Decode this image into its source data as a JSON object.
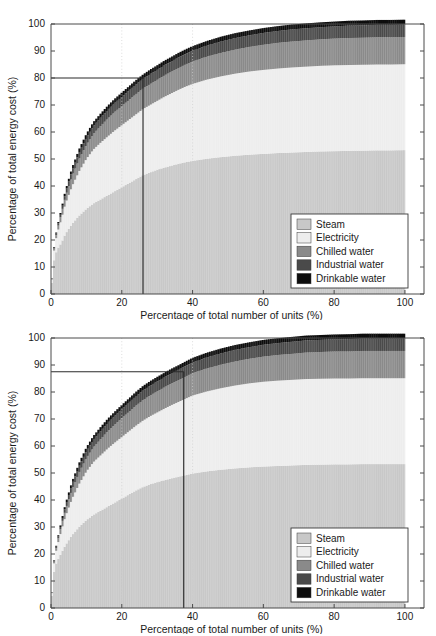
{
  "top_artifact": {
    "text": "cut-off caption remnant (illegible)"
  },
  "figures": [
    {
      "id": "upper",
      "name": "pareto-chart-80",
      "axis": {
        "xlabel": "Percentage of total number of units (%)",
        "ylabel": "Percentage of total energy cost (%)",
        "xticks": [
          "0",
          "20",
          "40",
          "60",
          "80",
          "100"
        ],
        "yticks": [
          "0",
          "10",
          "20",
          "30",
          "40",
          "50",
          "60",
          "70",
          "80",
          "90",
          "100"
        ]
      },
      "marker": {
        "y_value": "80",
        "x_value": "26"
      },
      "legend": {
        "items": [
          {
            "label": "Steam",
            "color": "#c8c8c8"
          },
          {
            "label": "Electricity",
            "color": "#ededed"
          },
          {
            "label": "Chilled water",
            "color": "#8a8a8a"
          },
          {
            "label": "Industrial water",
            "color": "#4a4a4a"
          },
          {
            "label": "Drinkable water",
            "color": "#0d0d0d"
          }
        ]
      }
    },
    {
      "id": "lower",
      "name": "pareto-chart-87",
      "axis": {
        "xlabel": "Percentage of total number of units (%)",
        "ylabel": "Percentage of total energy cost (%)",
        "xticks": [
          "0",
          "20",
          "40",
          "60",
          "80",
          "100"
        ],
        "yticks": [
          "0",
          "10",
          "20",
          "30",
          "40",
          "50",
          "60",
          "70",
          "80",
          "90",
          "100"
        ]
      },
      "marker": {
        "y_value": "87.5",
        "x_value": "37.5"
      },
      "legend": {
        "items": [
          {
            "label": "Steam",
            "color": "#c8c8c8"
          },
          {
            "label": "Electricity",
            "color": "#ededed"
          },
          {
            "label": "Chilled water",
            "color": "#8a8a8a"
          },
          {
            "label": "Industrial water",
            "color": "#4a4a4a"
          },
          {
            "label": "Drinkable water",
            "color": "#0d0d0d"
          }
        ]
      }
    }
  ],
  "chart_data": [
    {
      "type": "area",
      "title": "",
      "xlabel": "Percentage of total number of units (%)",
      "ylabel": "Percentage of total energy cost (%)",
      "xlim": [
        0,
        102
      ],
      "ylim": [
        0,
        100
      ],
      "grid": "vertical dashed at x = 20 and x = 40",
      "legend_position": "lower right",
      "annotation": {
        "type": "pareto-crosshair",
        "x": 26,
        "y": 80,
        "description": "26% of units account for 80% of total energy cost"
      },
      "x": [
        0,
        1,
        2,
        3,
        4,
        5,
        6,
        8,
        10,
        12,
        14,
        16,
        18,
        20,
        22,
        24,
        26,
        28,
        30,
        32,
        34,
        36,
        38,
        40,
        44,
        48,
        52,
        56,
        60,
        64,
        68,
        72,
        76,
        80,
        84,
        88,
        92,
        96,
        100
      ],
      "series": [
        {
          "name": "Steam",
          "values": [
            0,
            14,
            17,
            19,
            22,
            24,
            26,
            29,
            31.5,
            33.5,
            35,
            36.5,
            38,
            39.5,
            41,
            42.5,
            44,
            45,
            46,
            46.8,
            47.5,
            48.2,
            48.8,
            49.3,
            50.1,
            50.7,
            51.2,
            51.6,
            51.9,
            52.2,
            52.4,
            52.6,
            52.8,
            52.9,
            53,
            53.1,
            53.2,
            53.2,
            53.3
          ]
        },
        {
          "name": "Electricity",
          "values": [
            0,
            4,
            6.5,
            9,
            11,
            12.5,
            14,
            16.5,
            18.5,
            20,
            21,
            21.8,
            22.5,
            23,
            23.5,
            24,
            24.5,
            25,
            25.5,
            26.2,
            26.8,
            27.4,
            28,
            28.5,
            29.3,
            29.9,
            30.4,
            30.8,
            31.1,
            31.3,
            31.5,
            31.6,
            31.7,
            31.8,
            31.8,
            31.8,
            31.8,
            31.8,
            31.8
          ]
        },
        {
          "name": "Chilled water",
          "values": [
            0,
            0.8,
            1.4,
            2,
            2.6,
            3.2,
            3.8,
            4.6,
            5.2,
            5.8,
            6.2,
            6.6,
            6.9,
            7.1,
            7.3,
            7.5,
            7.6,
            7.7,
            7.8,
            7.9,
            8,
            8.1,
            8.2,
            8.3,
            8.5,
            8.7,
            8.9,
            9.1,
            9.3,
            9.5,
            9.6,
            9.7,
            9.8,
            9.9,
            10,
            10,
            10.1,
            10.1,
            10.1
          ]
        },
        {
          "name": "Industrial water",
          "values": [
            0,
            0.4,
            0.8,
            1.1,
            1.4,
            1.7,
            2,
            2.4,
            2.7,
            2.9,
            3.1,
            3.2,
            3.3,
            3.4,
            3.5,
            3.6,
            3.6,
            3.7,
            3.7,
            3.8,
            3.8,
            3.9,
            3.9,
            4,
            4.1,
            4.2,
            4.3,
            4.3,
            4.4,
            4.4,
            4.5,
            4.5,
            4.5,
            4.5,
            4.6,
            4.6,
            4.6,
            4.6,
            4.6
          ]
        },
        {
          "name": "Drinkable water",
          "values": [
            0,
            0.3,
            0.5,
            0.7,
            0.9,
            1,
            1.1,
            1.3,
            1.4,
            1.5,
            1.5,
            1.6,
            1.6,
            1.6,
            1.6,
            1.6,
            1.6,
            1.7,
            1.7,
            1.7,
            1.7,
            1.7,
            1.7,
            1.7,
            1.7,
            1.8,
            1.8,
            1.8,
            1.8,
            1.8,
            1.8,
            1.8,
            1.8,
            1.8,
            1.8,
            1.8,
            1.8,
            1.8,
            1.8
          ]
        }
      ],
      "cumulative_total": [
        0,
        19.5,
        26.2,
        31.8,
        37.9,
        42.4,
        46.9,
        53.8,
        59.3,
        63.7,
        66.8,
        69.7,
        72.3,
        74.6,
        76.9,
        79.2,
        81.3,
        83.1,
        84.7,
        86.4,
        87.8,
        89.3,
        90.6,
        91.8,
        93.7,
        95.3,
        96.6,
        97.6,
        98.5,
        99.2,
        99.8,
        100,
        100,
        100,
        100,
        100,
        100,
        100,
        100
      ]
    },
    {
      "type": "area",
      "title": "",
      "xlabel": "Percentage of total number of units (%)",
      "ylabel": "Percentage of total energy cost (%)",
      "xlim": [
        0,
        102
      ],
      "ylim": [
        0,
        100
      ],
      "grid": "vertical dashed at x = 20 and x = 40",
      "legend_position": "lower right",
      "annotation": {
        "type": "pareto-crosshair",
        "x": 37.5,
        "y": 87.5,
        "description": "37.5% of units account for 87.5% of total energy cost"
      },
      "x": [
        0,
        1,
        2,
        3,
        4,
        5,
        6,
        8,
        10,
        12,
        14,
        16,
        18,
        20,
        22,
        24,
        26,
        28,
        30,
        32,
        34,
        36,
        38,
        40,
        44,
        48,
        52,
        56,
        60,
        64,
        68,
        72,
        76,
        80,
        84,
        88,
        92,
        96,
        100
      ],
      "series": [
        {
          "name": "Steam",
          "values": [
            0,
            15,
            18,
            20.5,
            23,
            25,
            27,
            30,
            32.5,
            34.5,
            36,
            37.5,
            39,
            40.5,
            42,
            43.5,
            44.8,
            45.8,
            46.6,
            47.3,
            48,
            48.6,
            49.2,
            49.8,
            50.6,
            51.2,
            51.7,
            52.1,
            52.4,
            52.6,
            52.8,
            53,
            53.1,
            53.2,
            53.2,
            53.3,
            53.3,
            53.3,
            53.3
          ]
        },
        {
          "name": "Electricity",
          "values": [
            0,
            3.5,
            6,
            8.5,
            10.5,
            12,
            13.5,
            16,
            18,
            19.5,
            20.5,
            21.5,
            22.2,
            22.8,
            23.4,
            24,
            24.6,
            25.2,
            25.8,
            26.5,
            27.1,
            27.7,
            28.3,
            28.9,
            29.6,
            30.2,
            30.7,
            31.1,
            31.4,
            31.6,
            31.7,
            31.8,
            31.8,
            31.8,
            31.8,
            31.8,
            31.8,
            31.8,
            31.8
          ]
        },
        {
          "name": "Chilled water",
          "values": [
            0,
            0.7,
            1.3,
            1.9,
            2.4,
            3,
            3.5,
            4.3,
            5,
            5.5,
            6,
            6.4,
            6.7,
            7,
            7.2,
            7.4,
            7.6,
            7.7,
            7.8,
            7.9,
            8,
            8.1,
            8.2,
            8.3,
            8.5,
            8.7,
            8.9,
            9.1,
            9.3,
            9.5,
            9.6,
            9.8,
            9.9,
            10,
            10,
            10.1,
            10.1,
            10.1,
            10.1
          ]
        },
        {
          "name": "Industrial water",
          "values": [
            0,
            0.35,
            0.7,
            1,
            1.3,
            1.6,
            1.9,
            2.3,
            2.6,
            2.8,
            3,
            3.1,
            3.2,
            3.3,
            3.4,
            3.5,
            3.6,
            3.6,
            3.7,
            3.7,
            3.8,
            3.8,
            3.9,
            3.9,
            4.1,
            4.2,
            4.3,
            4.3,
            4.4,
            4.4,
            4.5,
            4.5,
            4.5,
            4.5,
            4.6,
            4.6,
            4.6,
            4.6,
            4.6
          ]
        },
        {
          "name": "Drinkable water",
          "values": [
            0,
            0.25,
            0.45,
            0.65,
            0.85,
            0.95,
            1.05,
            1.25,
            1.35,
            1.45,
            1.5,
            1.55,
            1.6,
            1.6,
            1.6,
            1.65,
            1.65,
            1.7,
            1.7,
            1.7,
            1.7,
            1.7,
            1.7,
            1.75,
            1.75,
            1.8,
            1.8,
            1.8,
            1.8,
            1.8,
            1.8,
            1.8,
            1.8,
            1.8,
            1.8,
            1.8,
            1.8,
            1.8,
            1.8
          ]
        }
      ],
      "cumulative_total": [
        0,
        19.8,
        26.45,
        32.55,
        38.05,
        42.55,
        46.95,
        53.85,
        59.45,
        63.75,
        67.0,
        70.05,
        72.7,
        75.2,
        77.6,
        80.05,
        82.25,
        84.0,
        85.58,
        87.1,
        88.6,
        89.9,
        91.3,
        92.65,
        94.55,
        96.1,
        97.4,
        98.41,
        99.34,
        99.9,
        100,
        100,
        100,
        100,
        100,
        100,
        100,
        100,
        100
      ]
    }
  ]
}
